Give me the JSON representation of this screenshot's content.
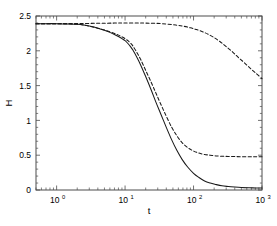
{
  "chart_data": {
    "type": "line",
    "title": "",
    "xlabel": "t",
    "ylabel": "H",
    "xscale": "log",
    "yscale": "linear",
    "xlim": [
      0.5,
      1000
    ],
    "ylim": [
      0,
      2.5
    ],
    "xticks": [
      1,
      10,
      100,
      1000
    ],
    "xticklabels": [
      "10^0",
      "10^1",
      "10^2",
      "10^3"
    ],
    "xtick_mantissas": [
      "10",
      "10",
      "10",
      "10"
    ],
    "xtick_exponents": [
      "0",
      "1",
      "2",
      "3"
    ],
    "yticks": [
      0,
      0.5,
      1,
      1.5,
      2,
      2.5
    ],
    "yticklabels": [
      "0",
      "0.5",
      "1",
      "1.5",
      "2",
      "2.5"
    ],
    "grid": false,
    "legend": null,
    "legend_position": "none",
    "axes_color": "#4d4d4d",
    "line_color": "#1a1a1a",
    "background_color": "#ffffff",
    "series": [
      {
        "name": "solid-curve",
        "style": "solid",
        "x": [
          0.5,
          0.7,
          1.0,
          1.5,
          2.0,
          2.5,
          3.0,
          4.0,
          5.0,
          6.0,
          7.0,
          8.0,
          9.0,
          10.0,
          11.0,
          12.0,
          13.0,
          15.0,
          17.0,
          20.0,
          24.0,
          28.0,
          33.0,
          40.0,
          48.0,
          57.0,
          68.0,
          82.0,
          100.0,
          120.0,
          145.0,
          175.0,
          210.0,
          260.0,
          320.0,
          400.0,
          500.0,
          650.0,
          800.0,
          1000.0
        ],
        "y": [
          2.39,
          2.39,
          2.39,
          2.385,
          2.38,
          2.37,
          2.355,
          2.325,
          2.295,
          2.265,
          2.235,
          2.205,
          2.175,
          2.145,
          2.105,
          2.06,
          2.01,
          1.9,
          1.79,
          1.63,
          1.44,
          1.27,
          1.1,
          0.9,
          0.72,
          0.57,
          0.44,
          0.33,
          0.24,
          0.18,
          0.13,
          0.1,
          0.08,
          0.06,
          0.05,
          0.042,
          0.036,
          0.032,
          0.03,
          0.028
        ]
      },
      {
        "name": "lower-dashed-curve",
        "style": "dashed",
        "x": [
          0.5,
          0.7,
          1.0,
          1.5,
          2.0,
          2.5,
          3.0,
          4.0,
          5.0,
          6.0,
          7.0,
          8.0,
          9.0,
          10.0,
          11.0,
          12.0,
          13.0,
          15.0,
          17.0,
          20.0,
          24.0,
          28.0,
          33.0,
          40.0,
          48.0,
          57.0,
          68.0,
          82.0,
          100.0,
          120.0,
          145.0,
          175.0,
          210.0,
          260.0,
          320.0,
          400.0,
          500.0,
          650.0,
          800.0,
          1000.0
        ],
        "y": [
          2.39,
          2.39,
          2.39,
          2.385,
          2.38,
          2.37,
          2.355,
          2.325,
          2.3,
          2.275,
          2.25,
          2.225,
          2.2,
          2.175,
          2.145,
          2.11,
          2.07,
          1.97,
          1.87,
          1.72,
          1.55,
          1.4,
          1.24,
          1.06,
          0.9,
          0.78,
          0.68,
          0.61,
          0.56,
          0.53,
          0.51,
          0.5,
          0.49,
          0.485,
          0.482,
          0.48,
          0.479,
          0.478,
          0.478,
          0.477
        ]
      },
      {
        "name": "upper-dashed-curve",
        "style": "dashed",
        "x": [
          0.5,
          1.0,
          2.0,
          4.0,
          7.0,
          10.0,
          15.0,
          20.0,
          28.0,
          40.0,
          55.0,
          70.0,
          90.0,
          110.0,
          135.0,
          165.0,
          200.0,
          245.0,
          300.0,
          370.0,
          450.0,
          550.0,
          680.0,
          820.0,
          1000.0
        ],
        "y": [
          2.39,
          2.39,
          2.392,
          2.395,
          2.398,
          2.4,
          2.4,
          2.398,
          2.395,
          2.385,
          2.37,
          2.355,
          2.33,
          2.305,
          2.275,
          2.235,
          2.19,
          2.13,
          2.06,
          1.985,
          1.905,
          1.83,
          1.745,
          1.675,
          1.6
        ]
      }
    ]
  }
}
